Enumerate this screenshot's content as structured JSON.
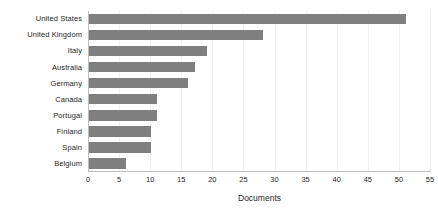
{
  "chart_data": {
    "type": "bar",
    "orientation": "horizontal",
    "title": "",
    "subtitle": "",
    "xlabel": "Documents",
    "ylabel": "",
    "categories": [
      "United States",
      "United Kingdom",
      "Italy",
      "Australia",
      "Germany",
      "Canada",
      "Portugal",
      "Finland",
      "Spain",
      "Belgium"
    ],
    "values": [
      51,
      28,
      19,
      17,
      16,
      11,
      11,
      10,
      10,
      6
    ],
    "xlim": [
      0,
      55
    ],
    "xticks": [
      0,
      5,
      10,
      15,
      20,
      25,
      30,
      35,
      40,
      45,
      50,
      55
    ],
    "xtick_labels": [
      "0",
      "5",
      "10",
      "15",
      "20",
      "25",
      "30",
      "35",
      "40",
      "45",
      "50",
      "55"
    ],
    "grid": true,
    "grid_axis": "x",
    "legend": false,
    "legend_position": "none",
    "bar_color": "#7f7f7f",
    "axis_color": "#bdbdbd",
    "grid_color": "#f0f0f0",
    "text_color": "#262626",
    "background_color": "#ffffff"
  }
}
